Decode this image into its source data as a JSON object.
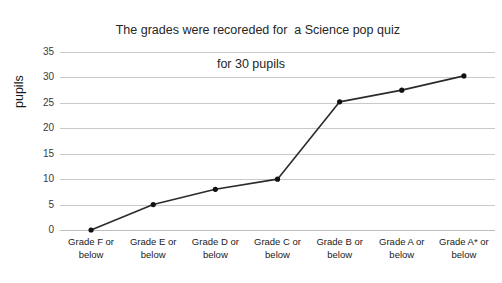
{
  "chart_data": {
    "type": "line",
    "title": "The grades were recoreded for  a Science pop quiz for 30 pupils",
    "title_line1": "The grades were recoreded for  a Science pop quiz",
    "title_line2": "for 30 pupils",
    "xlabel": "",
    "ylabel": "pupils",
    "categories": [
      "Grade F or below",
      "Grade E or below",
      "Grade D or below",
      "Grade C or below",
      "Grade B or below",
      "Grade A or below",
      "Grade A* or below"
    ],
    "category_lines": [
      [
        "Grade F or",
        "below"
      ],
      [
        "Grade E or",
        "below"
      ],
      [
        "Grade D or",
        "below"
      ],
      [
        "Grade C or",
        "below"
      ],
      [
        "Grade B or",
        "below"
      ],
      [
        "Grade A or",
        "below"
      ],
      [
        "Grade A* or",
        "below"
      ]
    ],
    "values": [
      0,
      5,
      8,
      10,
      25.2,
      27.5,
      30.3
    ],
    "ylim": [
      0,
      35
    ],
    "yticks": [
      0,
      5,
      10,
      15,
      20,
      25,
      30,
      35
    ],
    "grid": true,
    "legend": "none",
    "series_color": "#2b2b2b",
    "marker_color": "#111111",
    "gridline_color": "#c9c9c9",
    "background": "#ffffff"
  }
}
